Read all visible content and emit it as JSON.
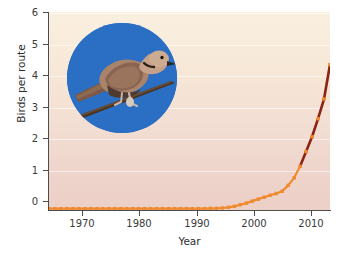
{
  "chart_data": {
    "type": "line",
    "title": "",
    "xlabel": "Year",
    "ylabel": "Birds per route",
    "xlim": [
      1966,
      2013
    ],
    "ylim": [
      0,
      6
    ],
    "xticks": [
      1970,
      1980,
      1990,
      2000,
      2010
    ],
    "xtick_labels": [
      "1970",
      "1980",
      "1990",
      "2000",
      "2010"
    ],
    "yticks": [
      0,
      1,
      2,
      3,
      4,
      5,
      6
    ],
    "ytick_labels": [
      "0",
      "1",
      "2",
      "3",
      "4",
      "5",
      "6"
    ],
    "grid": "horizontal-only",
    "legend": "none",
    "marker": "square",
    "marker_color": "#f08a2e",
    "line_color_early": "#f08a2e",
    "line_color_late": "#8c2313",
    "background_gradient": [
      "#faf0df",
      "#ecd0c8"
    ],
    "series": [
      {
        "name": "Birds per route",
        "x": [
          1966,
          1967,
          1968,
          1969,
          1970,
          1971,
          1972,
          1973,
          1974,
          1975,
          1976,
          1977,
          1978,
          1979,
          1980,
          1981,
          1982,
          1983,
          1984,
          1985,
          1986,
          1987,
          1988,
          1989,
          1990,
          1991,
          1992,
          1993,
          1994,
          1995,
          1996,
          1997,
          1998,
          1999,
          2000,
          2001,
          2002,
          2003,
          2004,
          2005,
          2006,
          2007,
          2008,
          2009,
          2010,
          2011,
          2012,
          2013
        ],
        "values": [
          0.01,
          0.01,
          0.01,
          0.01,
          0.01,
          0.01,
          0.01,
          0.01,
          0.01,
          0.01,
          0.01,
          0.01,
          0.01,
          0.01,
          0.01,
          0.01,
          0.01,
          0.01,
          0.01,
          0.01,
          0.01,
          0.01,
          0.01,
          0.01,
          0.01,
          0.01,
          0.01,
          0.02,
          0.02,
          0.03,
          0.05,
          0.08,
          0.13,
          0.18,
          0.24,
          0.3,
          0.36,
          0.42,
          0.47,
          0.54,
          0.72,
          0.95,
          1.3,
          1.75,
          2.2,
          2.75,
          3.35,
          4.4
        ]
      }
    ]
  },
  "inset": {
    "name": "eurasian-collared-dove-photo",
    "description": "Eurasian collared dove perched on a branch",
    "circle_color": "#2a6fc4"
  }
}
